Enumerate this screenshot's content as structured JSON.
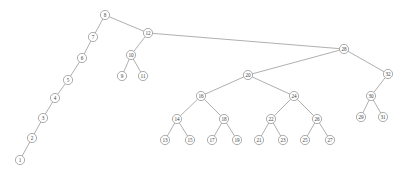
{
  "diagram": {
    "type": "binary-search-tree",
    "node_radius": 4.6,
    "colors": {
      "background": "#ffffff",
      "node_fill": "#ffffff",
      "node_stroke": "#8a8a8a",
      "edge_stroke": "#8c8c8c",
      "label_color": "#3d3d3d"
    },
    "nodes": [
      {
        "id": "n8",
        "label": "8",
        "x": 105,
        "y": 15
      },
      {
        "id": "n7",
        "label": "7",
        "x": 93,
        "y": 37
      },
      {
        "id": "n6",
        "label": "6",
        "x": 82,
        "y": 58
      },
      {
        "id": "n5",
        "label": "5",
        "x": 68,
        "y": 80
      },
      {
        "id": "n4",
        "label": "4",
        "x": 55,
        "y": 98
      },
      {
        "id": "n3",
        "label": "3",
        "x": 43,
        "y": 118
      },
      {
        "id": "n2",
        "label": "2",
        "x": 32,
        "y": 138
      },
      {
        "id": "n1",
        "label": "1",
        "x": 20,
        "y": 160
      },
      {
        "id": "n12",
        "label": "12",
        "x": 148,
        "y": 33
      },
      {
        "id": "n10",
        "label": "10",
        "x": 131,
        "y": 55
      },
      {
        "id": "n9",
        "label": "9",
        "x": 122,
        "y": 76
      },
      {
        "id": "n11",
        "label": "11",
        "x": 143,
        "y": 76
      },
      {
        "id": "n28",
        "label": "28",
        "x": 344,
        "y": 49
      },
      {
        "id": "n20",
        "label": "20",
        "x": 248,
        "y": 75
      },
      {
        "id": "n16",
        "label": "16",
        "x": 201,
        "y": 96
      },
      {
        "id": "n14",
        "label": "14",
        "x": 177,
        "y": 119
      },
      {
        "id": "n13",
        "label": "13",
        "x": 165,
        "y": 140
      },
      {
        "id": "n15",
        "label": "15",
        "x": 190,
        "y": 140
      },
      {
        "id": "n18",
        "label": "18",
        "x": 224,
        "y": 119
      },
      {
        "id": "n17",
        "label": "17",
        "x": 212,
        "y": 140
      },
      {
        "id": "n19",
        "label": "19",
        "x": 237,
        "y": 140
      },
      {
        "id": "n24",
        "label": "24",
        "x": 294,
        "y": 96
      },
      {
        "id": "n22",
        "label": "22",
        "x": 271,
        "y": 119
      },
      {
        "id": "n21",
        "label": "21",
        "x": 259,
        "y": 140
      },
      {
        "id": "n23",
        "label": "23",
        "x": 283,
        "y": 140
      },
      {
        "id": "n26",
        "label": "26",
        "x": 317,
        "y": 119
      },
      {
        "id": "n25",
        "label": "25",
        "x": 305,
        "y": 140
      },
      {
        "id": "n27",
        "label": "27",
        "x": 330,
        "y": 140
      },
      {
        "id": "n32",
        "label": "32",
        "x": 388,
        "y": 74
      },
      {
        "id": "n30",
        "label": "30",
        "x": 371,
        "y": 96
      },
      {
        "id": "n29",
        "label": "29",
        "x": 361,
        "y": 117
      },
      {
        "id": "n31",
        "label": "31",
        "x": 383,
        "y": 117
      }
    ],
    "edges": [
      {
        "from": "n8",
        "to": "n7"
      },
      {
        "from": "n8",
        "to": "n12"
      },
      {
        "from": "n7",
        "to": "n6"
      },
      {
        "from": "n6",
        "to": "n5"
      },
      {
        "from": "n5",
        "to": "n4"
      },
      {
        "from": "n4",
        "to": "n3"
      },
      {
        "from": "n3",
        "to": "n2"
      },
      {
        "from": "n2",
        "to": "n1"
      },
      {
        "from": "n12",
        "to": "n10"
      },
      {
        "from": "n12",
        "to": "n28"
      },
      {
        "from": "n10",
        "to": "n9"
      },
      {
        "from": "n10",
        "to": "n11"
      },
      {
        "from": "n28",
        "to": "n20"
      },
      {
        "from": "n28",
        "to": "n32"
      },
      {
        "from": "n20",
        "to": "n16"
      },
      {
        "from": "n20",
        "to": "n24"
      },
      {
        "from": "n16",
        "to": "n14"
      },
      {
        "from": "n16",
        "to": "n18"
      },
      {
        "from": "n14",
        "to": "n13"
      },
      {
        "from": "n14",
        "to": "n15"
      },
      {
        "from": "n18",
        "to": "n17"
      },
      {
        "from": "n18",
        "to": "n19"
      },
      {
        "from": "n24",
        "to": "n22"
      },
      {
        "from": "n24",
        "to": "n26"
      },
      {
        "from": "n22",
        "to": "n21"
      },
      {
        "from": "n22",
        "to": "n23"
      },
      {
        "from": "n26",
        "to": "n25"
      },
      {
        "from": "n26",
        "to": "n27"
      },
      {
        "from": "n32",
        "to": "n30"
      },
      {
        "from": "n30",
        "to": "n29"
      },
      {
        "from": "n30",
        "to": "n31"
      }
    ]
  }
}
